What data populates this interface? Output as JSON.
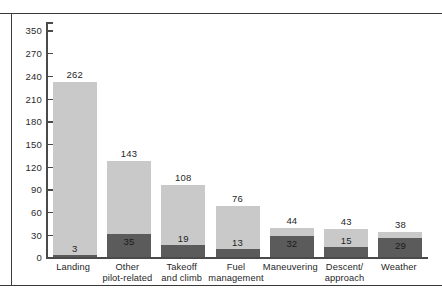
{
  "chart_data": {
    "type": "bar",
    "stacked": true,
    "title": "",
    "subtitle": "",
    "xlabel": "",
    "ylabel": "",
    "ylim": [
      0,
      350
    ],
    "grid": false,
    "legend_position": "none",
    "categories": [
      "Landing",
      "Other\npilot-related",
      "Takeoff\nand climb",
      "Fuel\nmanagement",
      "Maneuvering",
      "Descent/\napproach",
      "Weather"
    ],
    "category_lines": [
      [
        "Landing"
      ],
      [
        "Other",
        "pilot-related"
      ],
      [
        "Takeoff",
        "and climb"
      ],
      [
        "Fuel",
        "management"
      ],
      [
        "Maneuvering"
      ],
      [
        "Descent/",
        "approach"
      ],
      [
        "Weather"
      ]
    ],
    "ytick_labels": [
      "0",
      "30",
      "60",
      "90",
      "120",
      "150",
      "180",
      "210",
      "240",
      "270",
      "350"
    ],
    "ytick_values": [
      0,
      30,
      60,
      90,
      120,
      150,
      180,
      210,
      240,
      270,
      300
    ],
    "series": [
      {
        "name": "lower-segment",
        "color": "#5b5b5b",
        "values": [
          3,
          35,
          19,
          13,
          32,
          15,
          29
        ]
      },
      {
        "name": "upper-segment",
        "color": "#c9c9c9",
        "values": [
          259,
          108,
          89,
          63,
          12,
          28,
          9
        ]
      }
    ],
    "totals": [
      262,
      143,
      108,
      76,
      44,
      43,
      38
    ],
    "total_labels": [
      "262",
      "143",
      "108",
      "76",
      "44",
      "43",
      "38"
    ],
    "lower_labels": [
      "3",
      "35",
      "19",
      "13",
      "32",
      "15",
      "29"
    ],
    "colors": {
      "light_segment": "#c9c9c9",
      "dark_segment": "#5b5b5b",
      "axis": "#4a4a4a",
      "rule": "#3a3a3a",
      "text": "#1f1f1f"
    }
  }
}
